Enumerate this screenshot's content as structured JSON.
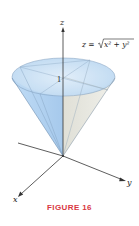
{
  "figure": {
    "caption": "FIGURE 16",
    "caption_color": "#d9373f",
    "equation": "z = √(x² + y²)",
    "equation_parts": {
      "lhs": "z = ",
      "radicand": "x² + y²"
    },
    "axes": {
      "x_label": "x",
      "y_label": "y",
      "z_label": "z"
    },
    "height_mark": "1",
    "colors": {
      "cone_left": "#a9cdef",
      "cone_right": "#d8d8cf",
      "cone_top": "#c9e0f5",
      "edge": "#6f8fb0",
      "axis": "#333333"
    }
  }
}
